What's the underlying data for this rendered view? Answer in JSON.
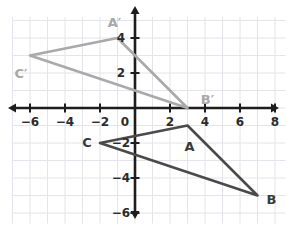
{
  "figure": {
    "type": "coordinate-plane",
    "title": "",
    "background": "#ffffff",
    "grid_color": "#e4e4ea",
    "axis_color": "#1d1d1d",
    "preimage_color": "#4a4a4a",
    "image_color": "#a9a9a9"
  },
  "axes": {
    "origin_px": {
      "x": 135,
      "y": 108
    },
    "unit_px": 17.5,
    "x_range": [
      -7,
      8.6
    ],
    "y_range": [
      -6.6,
      5.2
    ],
    "x_ticks": [
      {
        "value": -6,
        "label": "−6"
      },
      {
        "value": -4,
        "label": "−4"
      },
      {
        "value": -2,
        "label": "−2"
      },
      {
        "value": 2,
        "label": "2"
      },
      {
        "value": 4,
        "label": "4"
      },
      {
        "value": 6,
        "label": "6"
      },
      {
        "value": 8,
        "label": "8"
      }
    ],
    "y_ticks": [
      {
        "value": 4,
        "label": "4"
      },
      {
        "value": 2,
        "label": "2"
      },
      {
        "value": -2,
        "label": "−2"
      },
      {
        "value": -4,
        "label": "−4"
      },
      {
        "value": -6,
        "label": "−6"
      }
    ],
    "origin_label": "0"
  },
  "chart_data": {
    "type": "scatter",
    "title": "",
    "xlabel": "",
    "ylabel": "",
    "xlim": [
      -7,
      8.6
    ],
    "ylim": [
      -6.6,
      5.2
    ],
    "grid": true,
    "legend": "none",
    "series": [
      {
        "name": "Triangle ABC",
        "role": "preimage",
        "color": "#4a4a4a",
        "closed": true,
        "points": [
          {
            "label": "A",
            "x": 3,
            "y": -1
          },
          {
            "label": "B",
            "x": 7,
            "y": -5
          },
          {
            "label": "C",
            "x": -2,
            "y": -2
          }
        ]
      },
      {
        "name": "Triangle A'B'C'",
        "role": "image",
        "color": "#a9a9a9",
        "closed": true,
        "points": [
          {
            "label": "A′",
            "x": -1,
            "y": 4
          },
          {
            "label": "B′",
            "x": 3,
            "y": 0
          },
          {
            "label": "C′",
            "x": -6,
            "y": 3
          }
        ]
      }
    ]
  },
  "vertex_labels": [
    {
      "name": "A",
      "text": "A",
      "x": 3,
      "y": -1,
      "dx": 2,
      "dy": 20,
      "style": "pre"
    },
    {
      "name": "B",
      "text": "B",
      "x": 7,
      "y": -5,
      "dx": 14,
      "dy": 3,
      "style": "pre"
    },
    {
      "name": "C",
      "text": "C",
      "x": -2,
      "y": -2,
      "dx": -13,
      "dy": -1,
      "style": "pre"
    },
    {
      "name": "A-prime",
      "text": "A′",
      "x": -1,
      "y": 4,
      "dx": -3,
      "dy": -16,
      "style": "img"
    },
    {
      "name": "B-prime",
      "text": "B′",
      "x": 3,
      "y": 0,
      "dx": 20,
      "dy": -9,
      "style": "img"
    },
    {
      "name": "C-prime",
      "text": "C′",
      "x": -6,
      "y": 3,
      "dx": -9,
      "dy": 17,
      "style": "img"
    }
  ]
}
